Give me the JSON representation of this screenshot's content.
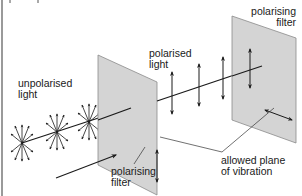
{
  "diagram": {
    "type": "physics-polarisation",
    "colors": {
      "filter_fill": "#d4d4d4",
      "filter_edge": "#8a8a8a",
      "line": "#1a1a1a",
      "border": "#9a9a9a",
      "background": "#ffffff"
    },
    "labels": {
      "unpolarised_light": [
        "unpolarised",
        "light"
      ],
      "polarised_light": [
        "polarised",
        "light"
      ],
      "polarising_filter_top": [
        "polarising",
        "filter"
      ],
      "polarising_filter_bottom": [
        "polarising",
        "filter"
      ],
      "allowed_plane": [
        "allowed plane",
        "of vibration"
      ]
    },
    "elements": {
      "unpolarised_wavefronts": 3,
      "polarised_vertical_arrows": 3,
      "filters": 2,
      "direction_arrow": "propagation direction"
    }
  }
}
